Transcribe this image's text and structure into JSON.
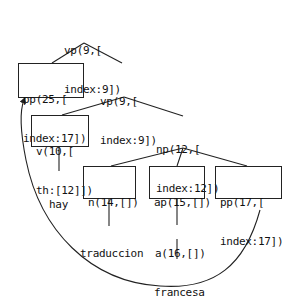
{
  "diagram": {
    "type": "parse-tree",
    "nodes": [
      {
        "id": "vp9_root",
        "lines": [
          "vp(9,[",
          "index:9])"
        ],
        "boxed": false
      },
      {
        "id": "pp25",
        "lines": [
          "pp(25,[",
          "index:17])"
        ],
        "boxed": true
      },
      {
        "id": "vp9_child",
        "lines": [
          "vp(9,[",
          "index:9])"
        ],
        "boxed": false
      },
      {
        "id": "v10",
        "lines": [
          "v(10,[",
          "th:[12]])"
        ],
        "boxed": true
      },
      {
        "id": "np12",
        "lines": [
          "np(12,[",
          "index:12])"
        ],
        "boxed": false
      },
      {
        "id": "hay",
        "lines": [
          "hay"
        ],
        "boxed": false
      },
      {
        "id": "n14",
        "lines": [
          "n(14,[])"
        ],
        "boxed": true
      },
      {
        "id": "ap15",
        "lines": [
          "ap(15,[])"
        ],
        "boxed": true
      },
      {
        "id": "pp17",
        "lines": [
          "pp(17,[",
          "index:17])"
        ],
        "boxed": true
      },
      {
        "id": "traduccion",
        "lines": [
          "traduccion"
        ],
        "boxed": false
      },
      {
        "id": "a16",
        "lines": [
          "a(16,[])"
        ],
        "boxed": false
      },
      {
        "id": "francesa",
        "lines": [
          "francesa"
        ],
        "boxed": false
      }
    ],
    "edges": [
      [
        "vp9_root",
        "pp25"
      ],
      [
        "vp9_root",
        "vp9_child"
      ],
      [
        "vp9_child",
        "v10"
      ],
      [
        "vp9_child",
        "np12"
      ],
      [
        "v10",
        "hay"
      ],
      [
        "np12",
        "n14"
      ],
      [
        "np12",
        "ap15"
      ],
      [
        "np12",
        "pp17"
      ],
      [
        "n14",
        "traduccion"
      ],
      [
        "ap15",
        "a16"
      ],
      [
        "a16",
        "francesa"
      ]
    ],
    "movement_arrow": {
      "from": "pp17",
      "to": "pp25",
      "style": "curved-arrow"
    }
  }
}
